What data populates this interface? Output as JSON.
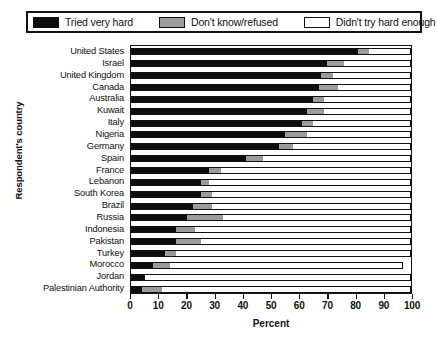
{
  "chart_data": {
    "type": "bar",
    "subtype": "stacked-horizontal-100",
    "title": "",
    "xlabel": "Percent",
    "ylabel": "Respondent's country",
    "xlim": [
      0,
      100
    ],
    "xticks": [
      0,
      10,
      20,
      30,
      40,
      50,
      60,
      70,
      80,
      90,
      100
    ],
    "grid": false,
    "legend_position": "top",
    "legend": [
      {
        "label": "Tried very hard",
        "color": "#0d0d0d"
      },
      {
        "label": "Don't know/refused",
        "color": "#9b9b9b"
      },
      {
        "label": "Didn't try hard enough",
        "color": "#ffffff"
      }
    ],
    "categories": [
      "United States",
      "Israel",
      "United Kingdom",
      "Canada",
      "Australia",
      "Kuwait",
      "Italy",
      "Nigeria",
      "Germany",
      "Spain",
      "France",
      "Lebanon",
      "South Korea",
      "Brazil",
      "Russia",
      "Indonesia",
      "Pakistan",
      "Turkey",
      "Morocco",
      "Jordan",
      "Palestinian Authority"
    ],
    "series": [
      {
        "name": "Tried very hard",
        "color": "#0d0d0d",
        "values": [
          81,
          70,
          68,
          67,
          65,
          63,
          61,
          55,
          53,
          41,
          28,
          25,
          25,
          22,
          20,
          16,
          16,
          12,
          8,
          5,
          4
        ]
      },
      {
        "name": "Don't know/refused",
        "color": "#9b9b9b",
        "values": [
          4,
          6,
          4,
          7,
          4,
          6,
          4,
          8,
          5,
          6,
          4,
          3,
          4,
          7,
          13,
          7,
          9,
          4,
          6,
          0,
          7
        ]
      },
      {
        "name": "Didn't try hard enough",
        "color": "#ffffff",
        "values": [
          15,
          24,
          28,
          26,
          31,
          31,
          35,
          37,
          42,
          53,
          68,
          72,
          71,
          71,
          67,
          77,
          75,
          84,
          83,
          95,
          89
        ]
      }
    ]
  }
}
